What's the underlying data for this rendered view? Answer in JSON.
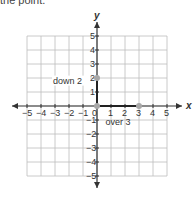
{
  "header_text": "the point.",
  "chart_data": {
    "type": "scatter",
    "title": "",
    "xlabel": "x",
    "ylabel": "y",
    "xlim": [
      -5,
      5
    ],
    "ylim": [
      -5,
      5
    ],
    "grid": true,
    "x_ticks": [
      "-5",
      "-4",
      "-3",
      "-2",
      "-1",
      "0",
      "1",
      "2",
      "3",
      "4",
      "5"
    ],
    "y_ticks": [
      "-5",
      "-4",
      "-3",
      "-2",
      "-1",
      "1",
      "2",
      "3",
      "4",
      "5"
    ],
    "points": [
      {
        "x": 0,
        "y": 2,
        "label": ""
      },
      {
        "x": 0,
        "y": 0,
        "label": ""
      },
      {
        "x": 3,
        "y": 0,
        "label": ""
      }
    ],
    "segments": [
      {
        "from": [
          0,
          2
        ],
        "to": [
          0,
          0
        ],
        "label": "down 2"
      },
      {
        "from": [
          0,
          0
        ],
        "to": [
          3,
          0
        ],
        "label": "over 3"
      }
    ],
    "annotations": [
      "down 2",
      "over 3"
    ]
  },
  "colors": {
    "grid": "#bdbdbd",
    "axis": "#333333",
    "point": "#a8a8a8",
    "path": "#222222"
  }
}
